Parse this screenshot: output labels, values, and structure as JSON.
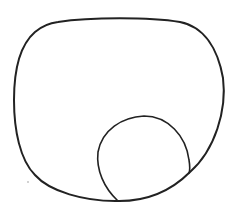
{
  "diagram": {
    "stroke_color": "#222222",
    "background": "#ffffff",
    "shapes": [
      {
        "id": "outer-shape",
        "kind": "rounded-blob"
      },
      {
        "id": "inner-circle",
        "kind": "circle",
        "cx": 144,
        "cy": 159,
        "r": 46
      }
    ]
  }
}
